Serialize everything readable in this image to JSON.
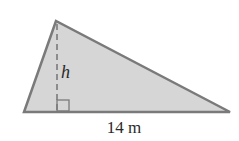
{
  "diagram": {
    "type": "triangle",
    "height_label": "h",
    "base_label": "14 m",
    "colors": {
      "fill": "#d6d6d6",
      "stroke": "#7a7a7a",
      "text": "#2a2a2a"
    },
    "vertices": {
      "apex": [
        56,
        21
      ],
      "bottom_left": [
        24,
        112
      ],
      "bottom_right": [
        230,
        112
      ]
    }
  }
}
